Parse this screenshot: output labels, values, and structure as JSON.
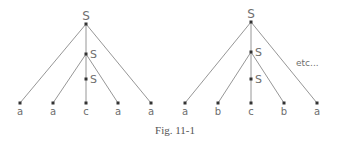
{
  "trees": [
    {
      "root": {
        "label": "S",
        "x": 86,
        "y": 24
      },
      "inner": [
        {
          "label": "S",
          "x": 86,
          "y": 54
        },
        {
          "label": "S",
          "x": 86,
          "y": 79
        }
      ],
      "leaves": [
        {
          "label": "a",
          "x": 20,
          "y": 103
        },
        {
          "label": "a",
          "x": 53,
          "y": 103
        },
        {
          "label": "c",
          "x": 86,
          "y": 103
        },
        {
          "label": "a",
          "x": 118,
          "y": 103
        },
        {
          "label": "a",
          "x": 151,
          "y": 103
        }
      ]
    },
    {
      "root": {
        "label": "S",
        "x": 251,
        "y": 22
      },
      "inner": [
        {
          "label": "S",
          "x": 251,
          "y": 52
        },
        {
          "label": "S",
          "x": 251,
          "y": 79
        }
      ],
      "leaves": [
        {
          "label": "a",
          "x": 185,
          "y": 103
        },
        {
          "label": "b",
          "x": 218,
          "y": 103
        },
        {
          "label": "c",
          "x": 251,
          "y": 103
        },
        {
          "label": "b",
          "x": 284,
          "y": 103
        },
        {
          "label": "a",
          "x": 317,
          "y": 103
        }
      ]
    }
  ],
  "etc_label": "etc...",
  "caption": "Fig. 11-1"
}
